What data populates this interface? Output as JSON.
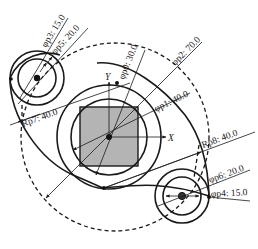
{
  "diagram": {
    "type": "parametric CAD sketch",
    "colors": {
      "line": "#1a1a1a",
      "square_fill": "#b4b4b4",
      "background": "#ffffff"
    },
    "axes": {
      "x_label": "X",
      "y_label": "Y"
    },
    "dimensions": {
      "p0": {
        "label": "φp0: 30.0",
        "kind": "diameter",
        "value": 30.0
      },
      "p1": {
        "label": "φp1: 40.0",
        "kind": "diameter",
        "value": 40.0
      },
      "p2": {
        "label": "φp2: 70.0",
        "kind": "diameter",
        "value": 70.0
      },
      "p3": {
        "label": "φp3: 15.0",
        "kind": "diameter",
        "value": 15.0
      },
      "p4": {
        "label": "φp4: 15.0",
        "kind": "diameter",
        "value": 15.0
      },
      "p5": {
        "label": "φp5: 20.0",
        "kind": "diameter",
        "value": 20.0
      },
      "p6": {
        "label": "φp6: 20.0",
        "kind": "diameter",
        "value": 20.0
      },
      "p7": {
        "label": "Rp7: 40.0",
        "kind": "radius",
        "value": 40.0
      },
      "p8": {
        "label": "Rp8: 40.0",
        "kind": "radius",
        "value": 40.0
      }
    }
  }
}
